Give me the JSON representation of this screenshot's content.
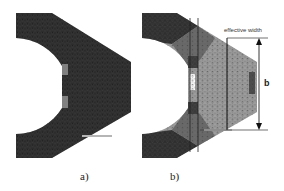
{
  "figure": {
    "panels": [
      {
        "id": "a",
        "caption": "a)",
        "description": "FE mesh of hook-shaped part, uniformly dark",
        "colors": {
          "body": "#2b2b2b",
          "mesh": "#444444",
          "patch": "#8a8a8a"
        }
      },
      {
        "id": "b",
        "caption": "b)",
        "description": "FE mesh of hook-shaped part with gray stress shading",
        "colors": {
          "dark": "#2e2e2e",
          "mid": "#6a6a6a",
          "light": "#9d9d9d",
          "mesh": "#555555"
        },
        "annotations": {
          "effective_width_label": "effective width",
          "dimension_label": "b"
        }
      }
    ]
  }
}
